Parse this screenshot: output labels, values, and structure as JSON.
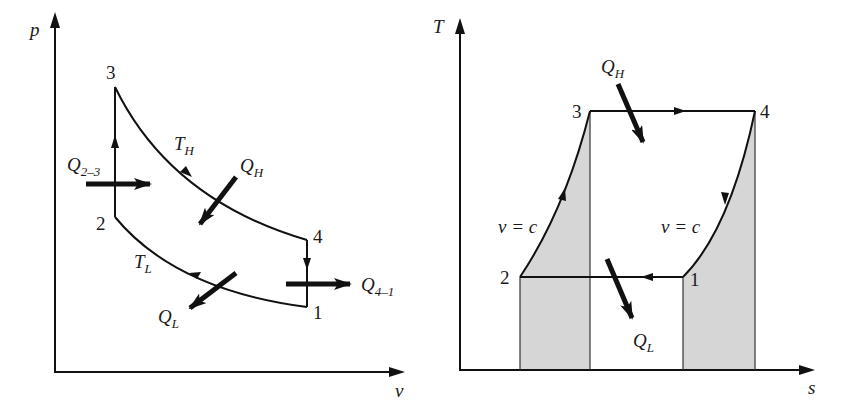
{
  "figure": {
    "left_plot": {
      "title": "p-v diagram (Stirling cycle)",
      "y_axis_label": "p",
      "x_axis_label": "v",
      "points": [
        {
          "id": "1",
          "label": "1"
        },
        {
          "id": "2",
          "label": "2"
        },
        {
          "id": "3",
          "label": "3"
        },
        {
          "id": "4",
          "label": "4"
        }
      ],
      "curve_labels": {
        "high": "T",
        "high_sub": "H",
        "low": "T",
        "low_sub": "L"
      },
      "heat_labels": {
        "q23": "Q",
        "q23_sub": "2–3",
        "qh": "Q",
        "qh_sub": "H",
        "q41": "Q",
        "q41_sub": "4–1",
        "ql": "Q",
        "ql_sub": "L"
      }
    },
    "right_plot": {
      "title": "T-s diagram (Stirling cycle)",
      "y_axis_label": "T",
      "x_axis_label": "s",
      "points": [
        {
          "id": "1",
          "label": "1"
        },
        {
          "id": "2",
          "label": "2"
        },
        {
          "id": "3",
          "label": "3"
        },
        {
          "id": "4",
          "label": "4"
        }
      ],
      "process_labels": {
        "left": "v = c",
        "right": "v = c"
      },
      "heat_labels": {
        "qh": "Q",
        "qh_sub": "H",
        "ql": "Q",
        "ql_sub": "L"
      },
      "shade_color": "#d6d6d6"
    }
  }
}
